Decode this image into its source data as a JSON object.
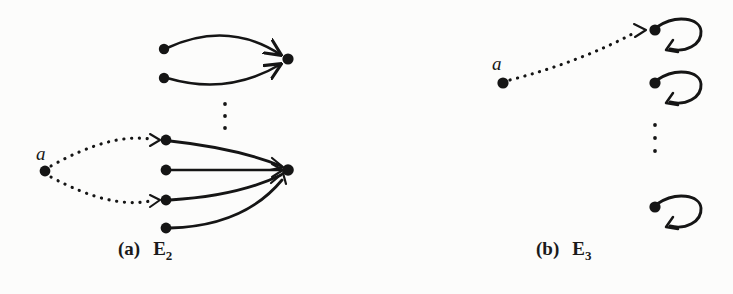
{
  "figure": {
    "background_color": "#fcfcfb",
    "ink_color": "#151515",
    "width": 733,
    "height": 294,
    "panels": [
      {
        "id": "panel-a",
        "caption_letter": "(a)",
        "caption_name": "E",
        "caption_subscript": "2",
        "source_label": "a",
        "description": "Directed graph with dotted edges from node a into two nodes of a lower cluster, solid curved edges converging on sink nodes",
        "nodes": [
          {
            "name": "top-cluster-source-upper",
            "x": 164,
            "y": 49
          },
          {
            "name": "top-cluster-source-lower",
            "x": 164,
            "y": 78
          },
          {
            "name": "top-cluster-sink",
            "x": 287,
            "y": 59
          },
          {
            "name": "source-node-a",
            "x": 45,
            "y": 171
          },
          {
            "name": "lower-cluster-node-1",
            "x": 166,
            "y": 140
          },
          {
            "name": "lower-cluster-node-2",
            "x": 166,
            "y": 170
          },
          {
            "name": "lower-cluster-node-3",
            "x": 166,
            "y": 200
          },
          {
            "name": "lower-cluster-node-4",
            "x": 166,
            "y": 228
          },
          {
            "name": "lower-cluster-sink",
            "x": 287,
            "y": 170
          }
        ],
        "ellipsis": {
          "x": 225,
          "y_points": [
            104,
            116,
            128
          ]
        },
        "dotted_edges": [
          {
            "from": "source-node-a",
            "to": "lower-cluster-node-1"
          },
          {
            "from": "source-node-a",
            "to": "lower-cluster-node-3"
          }
        ],
        "solid_edges": [
          {
            "from": "top-cluster-source-upper",
            "to": "top-cluster-sink"
          },
          {
            "from": "top-cluster-source-lower",
            "to": "top-cluster-sink"
          },
          {
            "from": "lower-cluster-node-1",
            "to": "lower-cluster-sink"
          },
          {
            "from": "lower-cluster-node-2",
            "to": "lower-cluster-sink"
          },
          {
            "from": "lower-cluster-node-3",
            "to": "lower-cluster-sink"
          },
          {
            "from": "lower-cluster-node-4",
            "to": "lower-cluster-sink"
          }
        ]
      },
      {
        "id": "panel-b",
        "caption_letter": "(b)",
        "caption_name": "E",
        "caption_subscript": "3",
        "source_label": "a",
        "description": "Directed graph with a dotted edge from node a to the first of a column of self-looping nodes",
        "nodes": [
          {
            "name": "source-node-a",
            "x": 503,
            "y": 83
          },
          {
            "name": "loop-node-1",
            "x": 655,
            "y": 30
          },
          {
            "name": "loop-node-2",
            "x": 655,
            "y": 83
          },
          {
            "name": "loop-node-3",
            "x": 655,
            "y": 207
          }
        ],
        "ellipsis": {
          "x": 655,
          "y_points": [
            125,
            138,
            151
          ]
        },
        "dotted_edges": [
          {
            "from": "source-node-a",
            "to": "loop-node-1"
          }
        ],
        "self_loops": [
          {
            "at": "loop-node-1"
          },
          {
            "at": "loop-node-2"
          },
          {
            "at": "loop-node-3"
          }
        ]
      }
    ]
  }
}
